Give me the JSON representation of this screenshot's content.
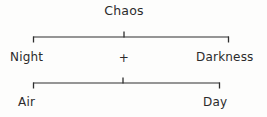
{
  "diagram": {
    "type": "derivation-tree",
    "title": "Chaos",
    "background_color": "#fdfdfc",
    "ink_color": "#2e2e2e",
    "text_color": "#2b2b2b",
    "levels": [
      {
        "name": "root",
        "nodes": [
          {
            "id": "chaos",
            "label": "Chaos"
          }
        ]
      },
      {
        "name": "first-generation",
        "nodes": [
          {
            "id": "night",
            "label": "Night"
          },
          {
            "id": "operator-1",
            "label": "+"
          },
          {
            "id": "darkness",
            "label": "Darkness"
          }
        ]
      },
      {
        "name": "second-generation",
        "nodes": [
          {
            "id": "air",
            "label": "Air"
          },
          {
            "id": "day",
            "label": "Day"
          }
        ]
      }
    ],
    "brackets": [
      {
        "id": "bracket-top",
        "parent": "chaos",
        "children": [
          "night",
          "darkness"
        ],
        "left_x": 33,
        "right_x": 229,
        "rule_y": 37,
        "end_tick_direction": "down",
        "center_tick_direction": "up",
        "center_x": 124
      },
      {
        "id": "bracket-bottom",
        "parent": "operator-1",
        "children": [
          "air",
          "day"
        ],
        "left_x": 33,
        "right_x": 220,
        "rule_y": 83,
        "end_tick_direction": "down",
        "center_tick_direction": "up",
        "center_x": 123
      }
    ]
  }
}
